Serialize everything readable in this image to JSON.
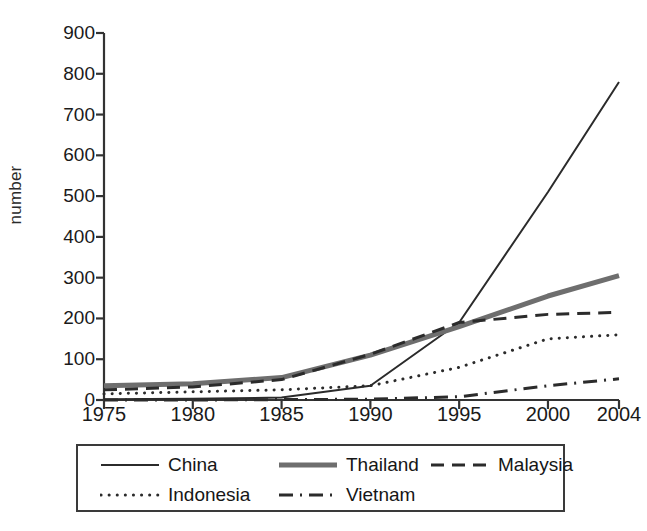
{
  "chart_data": {
    "type": "line",
    "title": "",
    "subtitle": "",
    "xlabel": "",
    "ylabel": "number",
    "xlim": [
      1975,
      2004
    ],
    "ylim": [
      0,
      900
    ],
    "grid": false,
    "legend_position": "bottom",
    "ytick_labels": [
      "900",
      "800",
      "700",
      "600",
      "500",
      "400",
      "300",
      "200",
      "100",
      "0"
    ],
    "ytick_values": [
      900,
      800,
      700,
      600,
      500,
      400,
      300,
      200,
      100,
      0
    ],
    "xtick_labels": [
      "1975",
      "1980",
      "1985",
      "1990",
      "1995",
      "2000",
      "2004"
    ],
    "xtick_values": [
      1975,
      1980,
      1985,
      1990,
      1995,
      2000,
      2004
    ],
    "x": [
      1975,
      1980,
      1985,
      1990,
      1995,
      2000,
      2004
    ],
    "series": [
      {
        "name": "China",
        "style": "solid",
        "color": "#2b2b2b",
        "width": 2,
        "values": [
          2,
          3,
          6,
          35,
          190,
          510,
          780
        ]
      },
      {
        "name": "Thailand",
        "style": "solid-thick",
        "color": "#6e6e6e",
        "width": 5,
        "values": [
          35,
          40,
          55,
          110,
          180,
          255,
          305
        ]
      },
      {
        "name": "Malaysia",
        "style": "dashed",
        "color": "#2b2b2b",
        "width": 3,
        "values": [
          25,
          32,
          50,
          112,
          190,
          210,
          215
        ]
      },
      {
        "name": "Indonesia",
        "style": "dotted",
        "color": "#2b2b2b",
        "width": 3,
        "values": [
          15,
          20,
          25,
          35,
          80,
          150,
          160
        ]
      },
      {
        "name": "Vietnam",
        "style": "dashdot",
        "color": "#2b2b2b",
        "width": 3,
        "values": [
          0,
          0,
          1,
          2,
          8,
          35,
          52
        ]
      }
    ]
  },
  "axis": {
    "y_label": "number",
    "y_ticks": [
      "900",
      "800",
      "700",
      "600",
      "500",
      "400",
      "300",
      "200",
      "100",
      "0"
    ],
    "x_ticks": [
      "1975",
      "1980",
      "1985",
      "1990",
      "1995",
      "2000",
      "2004"
    ]
  },
  "legend": {
    "entries": [
      {
        "label": "China",
        "style": "solid"
      },
      {
        "label": "Thailand",
        "style": "solid-thick"
      },
      {
        "label": "Malaysia",
        "style": "dashed"
      },
      {
        "label": "Indonesia",
        "style": "dotted"
      },
      {
        "label": "Vietnam",
        "style": "dashdot"
      }
    ]
  }
}
